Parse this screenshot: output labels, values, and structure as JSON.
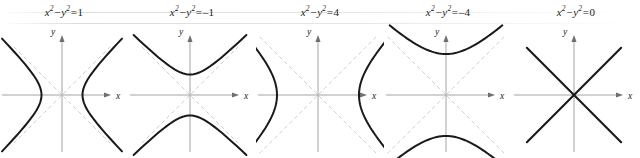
{
  "figure": {
    "background_color": "#ffffff",
    "curve_color": "#1a1a1a",
    "axis_color": "#9a9a9a",
    "asymptote_color": "#c8c8c8",
    "label_color": "#1a1a1a"
  },
  "chart_data": {
    "type": "line",
    "xlabel": "x",
    "ylabel": "y",
    "grid": false,
    "legend": "none",
    "xlim": [
      -3.2,
      3.2
    ],
    "ylim": [
      -3.2,
      3.2
    ],
    "panels": [
      {
        "equation_text": "x² − y² = 1",
        "lhs_base_1": "x",
        "lhs_exp_1": "2",
        "operator": "−",
        "lhs_base_2": "y",
        "lhs_exp_2": "2",
        "equals": "=",
        "rhs": "1",
        "constant": 1,
        "orientation": "horizontal",
        "vertices": [
          [
            -1,
            0
          ],
          [
            1,
            0
          ]
        ],
        "semi_axis": 1,
        "asymptotes": [
          "y = x",
          "y = -x"
        ],
        "asymptotes_visible": true,
        "xaxis_label": "x",
        "yaxis_label": "y"
      },
      {
        "equation_text": "x² − y² = −1",
        "lhs_base_1": "x",
        "lhs_exp_1": "2",
        "operator": "−",
        "lhs_base_2": "y",
        "lhs_exp_2": "2",
        "equals": "=",
        "rhs": "–1",
        "constant": -1,
        "orientation": "vertical",
        "vertices": [
          [
            0,
            -1
          ],
          [
            0,
            1
          ]
        ],
        "semi_axis": 1,
        "asymptotes": [
          "y = x",
          "y = -x"
        ],
        "asymptotes_visible": true,
        "xaxis_label": "x",
        "yaxis_label": "y"
      },
      {
        "equation_text": "x² − y² = 4",
        "lhs_base_1": "x",
        "lhs_exp_1": "2",
        "operator": "−",
        "lhs_base_2": "y",
        "lhs_exp_2": "2",
        "equals": "=",
        "rhs": "4",
        "constant": 4,
        "orientation": "horizontal",
        "vertices": [
          [
            -2,
            0
          ],
          [
            2,
            0
          ]
        ],
        "semi_axis": 2,
        "asymptotes": [
          "y = x",
          "y = -x"
        ],
        "asymptotes_visible": true,
        "xaxis_label": "x",
        "yaxis_label": "y"
      },
      {
        "equation_text": "x² − y² = −4",
        "lhs_base_1": "x",
        "lhs_exp_1": "2",
        "operator": "−",
        "lhs_base_2": "y",
        "lhs_exp_2": "2",
        "equals": "=",
        "rhs": "–4",
        "constant": -4,
        "orientation": "vertical",
        "vertices": [
          [
            0,
            -2
          ],
          [
            0,
            2
          ]
        ],
        "semi_axis": 2,
        "asymptotes": [
          "y = x",
          "y = -x"
        ],
        "asymptotes_visible": true,
        "xaxis_label": "x",
        "yaxis_label": "y"
      },
      {
        "equation_text": "x² − y² = 0",
        "lhs_base_1": "x",
        "lhs_exp_1": "2",
        "operator": "−",
        "lhs_base_2": "y",
        "lhs_exp_2": "2",
        "equals": "=",
        "rhs": "0",
        "constant": 0,
        "orientation": "degenerate",
        "vertices": [
          [
            0,
            0
          ]
        ],
        "semi_axis": 0,
        "asymptotes": [
          "y = x",
          "y = -x"
        ],
        "asymptotes_visible": false,
        "xaxis_label": "x",
        "yaxis_label": "y"
      }
    ]
  }
}
